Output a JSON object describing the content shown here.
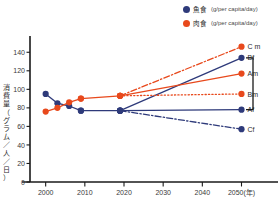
{
  "legend": {
    "items": [
      {
        "icon": "blue-dot-icon",
        "label": "魚食",
        "unit": "(g/per capita/day)",
        "color": "#2e3a7a"
      },
      {
        "icon": "red-dot-icon",
        "label": "肉食",
        "unit": "(g/per capita/day)",
        "color": "#e8491c"
      }
    ]
  },
  "axis": {
    "y_title_chars": [
      "消",
      "費",
      "量",
      "（",
      "グ",
      "ラ",
      "ム",
      "／",
      "人",
      "／",
      "日",
      "）"
    ],
    "x_unit": "(年)"
  },
  "chart_data": {
    "type": "line",
    "title": "",
    "xlabel": "年",
    "ylabel": "消費量（グラム／人／日）",
    "xlim": [
      1996,
      2056
    ],
    "ylim": [
      0,
      150
    ],
    "yticks": [
      0,
      20,
      40,
      60,
      80,
      100,
      120,
      140
    ],
    "xticks": [
      2000,
      2010,
      2020,
      2030,
      2040,
      2050
    ],
    "xtick_labels": [
      "2000",
      "2010",
      "2020",
      "2030",
      "2040",
      "2050(年)"
    ],
    "grid": false,
    "legend_position": "top-right",
    "colors": {
      "fish": "#2e3a7a",
      "meat": "#e8491c",
      "axis": "#1a1a1a",
      "bracket": "#1a1a1a"
    },
    "series": [
      {
        "name": "fish-historical",
        "label": "",
        "color": "#2e3a7a",
        "style": "solid",
        "marker": "circle",
        "x": [
          2000,
          2003,
          2006,
          2009
        ],
        "values": [
          95,
          85,
          82,
          77
        ]
      },
      {
        "name": "meat-historical",
        "label": "",
        "color": "#e8491c",
        "style": "solid",
        "marker": "circle",
        "x": [
          2000,
          2003,
          2006,
          2009
        ],
        "values": [
          76,
          80,
          86,
          90
        ]
      },
      {
        "name": "meat-baseline-to-2020",
        "label": "",
        "color": "#e8491c",
        "style": "solid",
        "marker": "circle",
        "x": [
          2009,
          2019
        ],
        "values": [
          90,
          93
        ]
      },
      {
        "name": "fish-baseline-to-2020",
        "label": "",
        "color": "#2e3a7a",
        "style": "solid",
        "marker": "circle",
        "x": [
          2009,
          2019
        ],
        "values": [
          77,
          77
        ]
      },
      {
        "name": "Cm",
        "label": "C m",
        "color": "#e8491c",
        "style": "dashdot",
        "marker": "circle",
        "x": [
          2019,
          2050
        ],
        "values": [
          93,
          146
        ],
        "endpoint_value": 146
      },
      {
        "name": "Bf",
        "label": "Bf",
        "color": "#2e3a7a",
        "style": "solid",
        "marker": "circle",
        "x": [
          2019,
          2050
        ],
        "values": [
          77,
          134
        ],
        "endpoint_value": 134
      },
      {
        "name": "Am",
        "label": "Am",
        "color": "#e8491c",
        "style": "solid",
        "marker": "circle",
        "x": [
          2019,
          2050
        ],
        "values": [
          93,
          117
        ],
        "endpoint_value": 117
      },
      {
        "name": "Bm",
        "label": "Bm",
        "color": "#e8491c",
        "style": "dotted",
        "marker": "circle",
        "x": [
          2019,
          2050
        ],
        "values": [
          93,
          95
        ],
        "endpoint_value": 95
      },
      {
        "name": "Af",
        "label": "Af",
        "color": "#2e3a7a",
        "style": "solid",
        "marker": "circle",
        "x": [
          2019,
          2050
        ],
        "values": [
          77,
          78
        ],
        "endpoint_value": 78
      },
      {
        "name": "Cf",
        "label": "Cf",
        "color": "#2e3a7a",
        "style": "dashdot",
        "marker": "circle",
        "x": [
          2019,
          2050
        ],
        "values": [
          77,
          57
        ],
        "endpoint_value": 57
      }
    ],
    "endpoint_labels": [
      "C m",
      "Bf",
      "Am",
      "Bm",
      "Af",
      "Cf"
    ],
    "annotations": [
      {
        "type": "bracket",
        "spans": [
          "Bf",
          "Af"
        ],
        "note": ""
      }
    ]
  }
}
